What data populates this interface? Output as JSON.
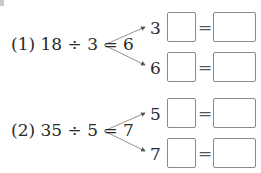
{
  "problems": [
    {
      "label": "(1) 18 ÷ 3 = 6",
      "rows": [
        {
          "factor": "3 ×",
          "equals": "=",
          "blank1": "",
          "blank2": ""
        },
        {
          "factor": "6 ×",
          "equals": "=",
          "blank1": "",
          "blank2": ""
        }
      ]
    },
    {
      "label": "(2) 35 ÷ 5 = 7",
      "rows": [
        {
          "factor": "5 ×",
          "equals": "=",
          "blank1": "",
          "blank2": ""
        },
        {
          "factor": "7 ×",
          "equals": "=",
          "blank1": "",
          "blank2": ""
        }
      ]
    }
  ],
  "icons": {
    "branch_arrow": "arrow-branch-icon"
  }
}
